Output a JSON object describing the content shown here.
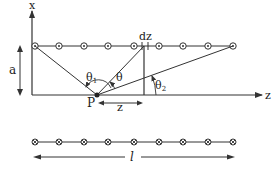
{
  "diagram": {
    "axes": {
      "x_label": "x",
      "z_label": "z"
    },
    "labels": {
      "height": "a",
      "element": "dz",
      "point": "P",
      "distance": "z",
      "theta": "θ",
      "theta1": "θ",
      "theta1_sub": "1",
      "theta2": "θ",
      "theta2_sub": "2",
      "length": "l"
    },
    "top_wire": {
      "current_symbol": "dot",
      "count": 9
    },
    "bottom_wire": {
      "current_symbol": "cross",
      "count": 9
    },
    "colors": {
      "line": "#333333",
      "background": "#ffffff"
    }
  }
}
